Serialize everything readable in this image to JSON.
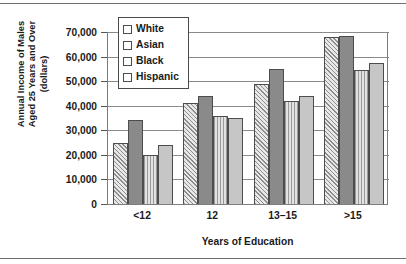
{
  "chart_data": {
    "type": "bar",
    "title": "",
    "xlabel": "Years of Education",
    "ylabel": "Annual Income of Males Aged 25 Years and Over (dollars)",
    "ylabel_lines": [
      "Annual Income of Males",
      "Aged 25 Years and Over",
      "(dollars)"
    ],
    "categories": [
      "<12",
      "12",
      "13–15",
      ">15"
    ],
    "series": [
      {
        "name": "White",
        "values": [
          25000,
          41000,
          49000,
          68000
        ],
        "pattern": "diagonal-hatch",
        "color": "#e8e8e8"
      },
      {
        "name": "Asian",
        "values": [
          34000,
          44000,
          55000,
          68500
        ],
        "pattern": "solid-dark",
        "color": "#8a8a8a"
      },
      {
        "name": "Black",
        "values": [
          20000,
          36000,
          42000,
          54500
        ],
        "pattern": "vertical-stripe",
        "color": "#e2e2e2"
      },
      {
        "name": "Hispanic",
        "values": [
          24000,
          35000,
          44000,
          57500
        ],
        "pattern": "solid-light",
        "color": "#c6c6c6"
      }
    ],
    "ylim": [
      0,
      70000
    ],
    "ytick_values": [
      0,
      10000,
      20000,
      30000,
      40000,
      50000,
      60000,
      70000
    ],
    "ytick_labels": [
      "0",
      "10,000",
      "20,000",
      "30,000",
      "40,000",
      "50,000",
      "60,000",
      "70,000"
    ],
    "grid": true,
    "legend_position": "top-left-inside"
  }
}
